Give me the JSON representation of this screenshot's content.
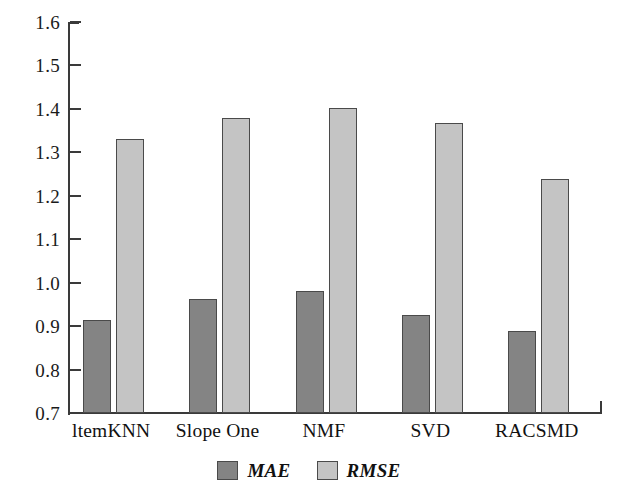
{
  "chart_data": {
    "type": "bar",
    "title": "",
    "subtitle": "",
    "xlabel": "",
    "ylabel": "",
    "categories": [
      "ltemKNN",
      "Slope One",
      "NMF",
      "SVD",
      "RACSMD"
    ],
    "series": [
      {
        "name": "MAE",
        "color": "#848484",
        "values": [
          0.915,
          0.962,
          0.98,
          0.925,
          0.888
        ]
      },
      {
        "name": "RMSE",
        "color": "#c4c4c4",
        "values": [
          1.33,
          1.38,
          1.402,
          1.367,
          1.238
        ]
      }
    ],
    "ylim": [
      0.7,
      1.6
    ],
    "ytick_labels": [
      "1.6",
      "1.5",
      "1.4",
      "1.3",
      "1.2",
      "1.1",
      "1.0",
      "0.9",
      "0.8",
      "0.7"
    ],
    "ytick_values": [
      1.6,
      1.5,
      1.4,
      1.3,
      1.2,
      1.1,
      1.0,
      0.9,
      0.8,
      0.7
    ],
    "ytick_step": 0.1,
    "grid": false,
    "legend_position": "bottom-center",
    "legend_entries": [
      "MAE",
      "RMSE"
    ],
    "axis_color": "#3a3a3a",
    "bar_edge_color": "#4a4a4a",
    "background": "#ffffff"
  }
}
